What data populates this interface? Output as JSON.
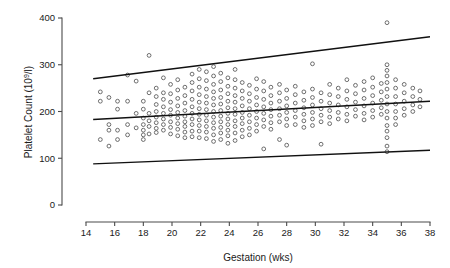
{
  "chart_data": {
    "type": "scatter",
    "title": "",
    "xlabel": "Gestation (wks)",
    "ylabel": "Platelet Count (10⁹/l)",
    "ylabel_main": "Platelet Count (10",
    "ylabel_sup": "9",
    "ylabel_tail": "/l)",
    "xlim": [
      14,
      38
    ],
    "ylim": [
      0,
      400
    ],
    "xticks": [
      14,
      16,
      18,
      20,
      22,
      24,
      26,
      28,
      30,
      32,
      34,
      36,
      38
    ],
    "yticks": [
      0,
      100,
      200,
      300,
      400
    ],
    "xtick_labels": [
      "14",
      "16",
      "18",
      "20",
      "22",
      "24",
      "26",
      "28",
      "30",
      "32",
      "34",
      "36",
      "38"
    ],
    "ytick_labels": [
      "0",
      "100",
      "200",
      "300",
      "400"
    ],
    "grid": false,
    "legend": "none",
    "marker": "open-circle",
    "marker_color": "#555555",
    "line_color": "#111111",
    "background": "#ffffff",
    "reference_lines": [
      {
        "name": "upper-reference-line",
        "x": [
          14.5,
          38.0
        ],
        "y": [
          270,
          360
        ]
      },
      {
        "name": "median-reference-line",
        "x": [
          14.5,
          38.0
        ],
        "y": [
          183,
          222
        ]
      },
      {
        "name": "lower-reference-line",
        "x": [
          14.5,
          38.0
        ],
        "y": [
          88,
          117
        ]
      }
    ],
    "points": [
      [
        15.0,
        242
      ],
      [
        15.0,
        222
      ],
      [
        15.0,
        140
      ],
      [
        15.6,
        230
      ],
      [
        15.6,
        172
      ],
      [
        15.6,
        160
      ],
      [
        15.6,
        126
      ],
      [
        16.2,
        222
      ],
      [
        16.2,
        205
      ],
      [
        16.2,
        160
      ],
      [
        16.2,
        140
      ],
      [
        16.9,
        278
      ],
      [
        16.9,
        222
      ],
      [
        16.9,
        172
      ],
      [
        16.9,
        150
      ],
      [
        17.5,
        265
      ],
      [
        17.5,
        196
      ],
      [
        17.5,
        165
      ],
      [
        18.0,
        222
      ],
      [
        18.0,
        205
      ],
      [
        18.0,
        186
      ],
      [
        18.0,
        172
      ],
      [
        18.0,
        160
      ],
      [
        18.0,
        150
      ],
      [
        18.0,
        140
      ],
      [
        18.4,
        320
      ],
      [
        18.4,
        240
      ],
      [
        18.4,
        196
      ],
      [
        18.4,
        180
      ],
      [
        18.4,
        168
      ],
      [
        18.4,
        152
      ],
      [
        18.9,
        250
      ],
      [
        18.9,
        232
      ],
      [
        18.9,
        215
      ],
      [
        18.9,
        200
      ],
      [
        18.9,
        188
      ],
      [
        18.9,
        176
      ],
      [
        18.9,
        164
      ],
      [
        18.9,
        155
      ],
      [
        19.4,
        272
      ],
      [
        19.4,
        240
      ],
      [
        19.4,
        226
      ],
      [
        19.4,
        210
      ],
      [
        19.4,
        196
      ],
      [
        19.4,
        184
      ],
      [
        19.4,
        172
      ],
      [
        19.4,
        160
      ],
      [
        19.9,
        258
      ],
      [
        19.9,
        238
      ],
      [
        19.9,
        220
      ],
      [
        19.9,
        204
      ],
      [
        19.9,
        192
      ],
      [
        19.9,
        178
      ],
      [
        19.9,
        166
      ],
      [
        19.9,
        152
      ],
      [
        20.4,
        268
      ],
      [
        20.4,
        246
      ],
      [
        20.4,
        228
      ],
      [
        20.4,
        212
      ],
      [
        20.4,
        198
      ],
      [
        20.4,
        186
      ],
      [
        20.4,
        174
      ],
      [
        20.4,
        162
      ],
      [
        20.4,
        148
      ],
      [
        20.9,
        252
      ],
      [
        20.9,
        234
      ],
      [
        20.9,
        218
      ],
      [
        20.9,
        202
      ],
      [
        20.9,
        190
      ],
      [
        20.9,
        178
      ],
      [
        20.9,
        168
      ],
      [
        20.9,
        156
      ],
      [
        20.9,
        144
      ],
      [
        21.4,
        280
      ],
      [
        21.4,
        262
      ],
      [
        21.4,
        244
      ],
      [
        21.4,
        226
      ],
      [
        21.4,
        210
      ],
      [
        21.4,
        196
      ],
      [
        21.4,
        184
      ],
      [
        21.4,
        172
      ],
      [
        21.4,
        158
      ],
      [
        21.4,
        146
      ],
      [
        21.9,
        290
      ],
      [
        21.9,
        270
      ],
      [
        21.9,
        252
      ],
      [
        21.9,
        236
      ],
      [
        21.9,
        220
      ],
      [
        21.9,
        206
      ],
      [
        21.9,
        194
      ],
      [
        21.9,
        182
      ],
      [
        21.9,
        170
      ],
      [
        21.9,
        158
      ],
      [
        21.9,
        144
      ],
      [
        22.4,
        285
      ],
      [
        22.4,
        266
      ],
      [
        22.4,
        248
      ],
      [
        22.4,
        232
      ],
      [
        22.4,
        218
      ],
      [
        22.4,
        204
      ],
      [
        22.4,
        192
      ],
      [
        22.4,
        180
      ],
      [
        22.4,
        168
      ],
      [
        22.4,
        156
      ],
      [
        22.4,
        142
      ],
      [
        22.9,
        296
      ],
      [
        22.9,
        276
      ],
      [
        22.9,
        258
      ],
      [
        22.9,
        242
      ],
      [
        22.9,
        228
      ],
      [
        22.9,
        214
      ],
      [
        22.9,
        200
      ],
      [
        22.9,
        188
      ],
      [
        22.9,
        176
      ],
      [
        22.9,
        164
      ],
      [
        22.9,
        150
      ],
      [
        22.9,
        136
      ],
      [
        23.4,
        282
      ],
      [
        23.4,
        264
      ],
      [
        23.4,
        246
      ],
      [
        23.4,
        230
      ],
      [
        23.4,
        216
      ],
      [
        23.4,
        202
      ],
      [
        23.4,
        190
      ],
      [
        23.4,
        178
      ],
      [
        23.4,
        166
      ],
      [
        23.4,
        154
      ],
      [
        23.4,
        140
      ],
      [
        23.9,
        272
      ],
      [
        23.9,
        254
      ],
      [
        23.9,
        238
      ],
      [
        23.9,
        222
      ],
      [
        23.9,
        208
      ],
      [
        23.9,
        196
      ],
      [
        23.9,
        184
      ],
      [
        23.9,
        172
      ],
      [
        23.9,
        160
      ],
      [
        23.9,
        148
      ],
      [
        23.9,
        132
      ],
      [
        24.4,
        290
      ],
      [
        24.4,
        268
      ],
      [
        24.4,
        250
      ],
      [
        24.4,
        234
      ],
      [
        24.4,
        220
      ],
      [
        24.4,
        206
      ],
      [
        24.4,
        194
      ],
      [
        24.4,
        180
      ],
      [
        24.4,
        168
      ],
      [
        24.4,
        154
      ],
      [
        24.4,
        138
      ],
      [
        24.9,
        262
      ],
      [
        24.9,
        244
      ],
      [
        24.9,
        228
      ],
      [
        24.9,
        212
      ],
      [
        24.9,
        198
      ],
      [
        24.9,
        186
      ],
      [
        24.9,
        174
      ],
      [
        24.9,
        160
      ],
      [
        24.9,
        146
      ],
      [
        25.4,
        256
      ],
      [
        25.4,
        238
      ],
      [
        25.4,
        222
      ],
      [
        25.4,
        206
      ],
      [
        25.4,
        192
      ],
      [
        25.4,
        178
      ],
      [
        25.4,
        164
      ],
      [
        25.4,
        150
      ],
      [
        25.9,
        270
      ],
      [
        25.9,
        248
      ],
      [
        25.9,
        230
      ],
      [
        25.9,
        214
      ],
      [
        25.9,
        200
      ],
      [
        25.9,
        186
      ],
      [
        25.9,
        172
      ],
      [
        25.9,
        158
      ],
      [
        26.4,
        264
      ],
      [
        26.4,
        244
      ],
      [
        26.4,
        226
      ],
      [
        26.4,
        210
      ],
      [
        26.4,
        196
      ],
      [
        26.4,
        182
      ],
      [
        26.4,
        168
      ],
      [
        26.4,
        120
      ],
      [
        26.9,
        252
      ],
      [
        26.9,
        234
      ],
      [
        26.9,
        218
      ],
      [
        26.9,
        204
      ],
      [
        26.9,
        190
      ],
      [
        26.9,
        176
      ],
      [
        26.9,
        162
      ],
      [
        27.5,
        258
      ],
      [
        27.5,
        240
      ],
      [
        27.5,
        222
      ],
      [
        27.5,
        206
      ],
      [
        27.5,
        192
      ],
      [
        27.5,
        178
      ],
      [
        27.5,
        140
      ],
      [
        28.0,
        246
      ],
      [
        28.0,
        228
      ],
      [
        28.0,
        212
      ],
      [
        28.0,
        198
      ],
      [
        28.0,
        184
      ],
      [
        28.0,
        170
      ],
      [
        28.0,
        128
      ],
      [
        28.6,
        254
      ],
      [
        28.6,
        236
      ],
      [
        28.6,
        218
      ],
      [
        28.6,
        202
      ],
      [
        28.6,
        188
      ],
      [
        28.6,
        172
      ],
      [
        29.2,
        242
      ],
      [
        29.2,
        224
      ],
      [
        29.2,
        208
      ],
      [
        29.2,
        194
      ],
      [
        29.2,
        180
      ],
      [
        29.2,
        166
      ],
      [
        29.8,
        302
      ],
      [
        29.8,
        248
      ],
      [
        29.8,
        230
      ],
      [
        29.8,
        214
      ],
      [
        29.8,
        198
      ],
      [
        29.8,
        184
      ],
      [
        29.8,
        170
      ],
      [
        30.4,
        240
      ],
      [
        30.4,
        222
      ],
      [
        30.4,
        206
      ],
      [
        30.4,
        192
      ],
      [
        30.4,
        178
      ],
      [
        30.4,
        130
      ],
      [
        31.0,
        258
      ],
      [
        31.0,
        236
      ],
      [
        31.0,
        218
      ],
      [
        31.0,
        202
      ],
      [
        31.0,
        188
      ],
      [
        31.0,
        174
      ],
      [
        31.6,
        250
      ],
      [
        31.6,
        232
      ],
      [
        31.6,
        214
      ],
      [
        31.6,
        198
      ],
      [
        31.6,
        184
      ],
      [
        32.2,
        268
      ],
      [
        32.2,
        244
      ],
      [
        32.2,
        226
      ],
      [
        32.2,
        210
      ],
      [
        32.2,
        194
      ],
      [
        32.2,
        180
      ],
      [
        32.8,
        256
      ],
      [
        32.8,
        238
      ],
      [
        32.8,
        220
      ],
      [
        32.8,
        204
      ],
      [
        32.8,
        190
      ],
      [
        33.4,
        264
      ],
      [
        33.4,
        246
      ],
      [
        33.4,
        228
      ],
      [
        33.4,
        212
      ],
      [
        33.4,
        196
      ],
      [
        33.4,
        182
      ],
      [
        34.0,
        272
      ],
      [
        34.0,
        252
      ],
      [
        34.0,
        234
      ],
      [
        34.0,
        218
      ],
      [
        34.0,
        202
      ],
      [
        34.0,
        188
      ],
      [
        34.6,
        260
      ],
      [
        34.6,
        242
      ],
      [
        34.6,
        224
      ],
      [
        34.6,
        208
      ],
      [
        34.6,
        194
      ],
      [
        35.0,
        390
      ],
      [
        35.0,
        300
      ],
      [
        35.0,
        288
      ],
      [
        35.0,
        276
      ],
      [
        35.0,
        262
      ],
      [
        35.0,
        248
      ],
      [
        35.0,
        232
      ],
      [
        35.0,
        216
      ],
      [
        35.0,
        200
      ],
      [
        35.0,
        186
      ],
      [
        35.0,
        170
      ],
      [
        35.0,
        158
      ],
      [
        35.0,
        144
      ],
      [
        35.0,
        126
      ],
      [
        35.0,
        114
      ],
      [
        35.6,
        268
      ],
      [
        35.6,
        250
      ],
      [
        35.6,
        232
      ],
      [
        35.6,
        216
      ],
      [
        35.6,
        200
      ],
      [
        35.6,
        186
      ],
      [
        35.6,
        172
      ],
      [
        36.2,
        258
      ],
      [
        36.2,
        240
      ],
      [
        36.2,
        222
      ],
      [
        36.2,
        206
      ],
      [
        36.2,
        192
      ],
      [
        36.8,
        250
      ],
      [
        36.8,
        232
      ],
      [
        36.8,
        214
      ],
      [
        36.8,
        200
      ],
      [
        37.3,
        244
      ],
      [
        37.3,
        226
      ],
      [
        37.3,
        210
      ]
    ]
  }
}
